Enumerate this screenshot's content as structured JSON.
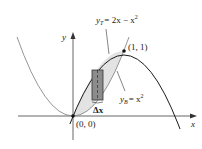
{
  "diagram": {
    "axes": {
      "x_label": "x",
      "y_label": "y"
    },
    "curves": [
      {
        "name": "top",
        "label_var": "y",
        "label_sub": "T",
        "label_rhs": "= 2x − x",
        "label_sup": "2",
        "color": "#1a1a1a"
      },
      {
        "name": "bottom",
        "label_var": "y",
        "label_sub": "B",
        "label_rhs": "= x",
        "label_sup": "2",
        "color": "#888888"
      }
    ],
    "points": [
      {
        "label": "(0, 0)"
      },
      {
        "label": "(1, 1)"
      }
    ],
    "strip": {
      "label": "Δx",
      "fill": "#8c8c8c"
    },
    "region_fill": "#e3e3e3"
  }
}
